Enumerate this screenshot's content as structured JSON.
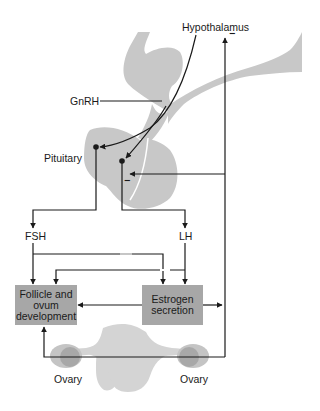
{
  "diagram": {
    "labels": {
      "hypothalamus": "Hypothalamus",
      "gnrh": "GnRH",
      "pituitary": "Pituitary",
      "fsh": "FSH",
      "lh": "LH",
      "ovary_left": "Ovary",
      "ovary_right": "Ovary"
    },
    "boxes": {
      "follicle": "Follicle and ovum development",
      "estrogen": "Estrogen secretion"
    },
    "feedback_signs": {
      "hypothalamus": "−",
      "pituitary": "−"
    },
    "colors": {
      "tissue": "#c8c8c8",
      "box": "#a7a7a7",
      "ovary": "#b5b5b5",
      "line": "#1a1a1a"
    }
  }
}
